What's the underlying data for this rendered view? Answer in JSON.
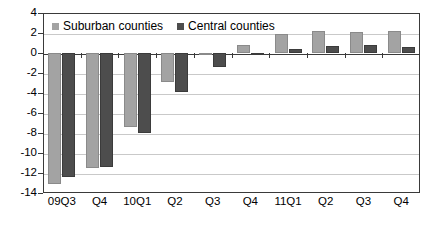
{
  "chart_data": {
    "type": "bar",
    "title": "",
    "xlabel": "",
    "ylabel": "",
    "categories": [
      "09Q3",
      "Q4",
      "10Q1",
      "Q2",
      "Q3",
      "Q4",
      "11Q1",
      "Q2",
      "Q3",
      "Q4"
    ],
    "series": [
      {
        "name": "Suburban counties",
        "color": "#a3a3a3",
        "values": [
          -13.1,
          -11.5,
          -7.4,
          -2.9,
          -0.2,
          0.8,
          1.9,
          2.2,
          2.1,
          2.2
        ]
      },
      {
        "name": "Central counties",
        "color": "#4d4d4d",
        "values": [
          -12.4,
          -11.4,
          -8.0,
          -3.9,
          -1.4,
          -0.1,
          0.45,
          0.75,
          0.8,
          0.65
        ]
      }
    ],
    "ylim": [
      -14,
      4
    ],
    "ytick_values": [
      4,
      2,
      0,
      -2,
      -4,
      -6,
      -8,
      -10,
      -12,
      -14
    ],
    "ytick_labels": [
      "4",
      "2",
      "0",
      "-2",
      "-4",
      "-6",
      "-8",
      "-10",
      "-12",
      "-14"
    ],
    "grid": true,
    "legend_position": "top-left"
  },
  "legend": {
    "entries": [
      {
        "label": "Suburban counties"
      },
      {
        "label": "Central counties"
      }
    ]
  }
}
